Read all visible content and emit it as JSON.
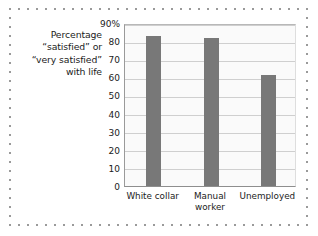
{
  "caption": {
    "lines": [
      "Percentage",
      "“satisfied” or",
      "“very satisfied”",
      "with life"
    ]
  },
  "chart_data": {
    "type": "bar",
    "title": "",
    "subtitle": "",
    "xlabel": "",
    "ylabel": "Percentage “satisfied” or “very satisfied” with life",
    "categories": [
      "White collar",
      "Manual worker",
      "Unemployed"
    ],
    "category_lines": [
      [
        "White collar"
      ],
      [
        "Manual",
        "worker"
      ],
      [
        "Unemployed"
      ]
    ],
    "values": [
      83,
      81.5,
      61.5
    ],
    "ylim": [
      0,
      90
    ],
    "yticks": [
      0,
      10,
      20,
      30,
      40,
      50,
      60,
      70,
      80,
      90
    ],
    "ytick_labels": [
      "0",
      "10",
      "20",
      "30",
      "40",
      "50",
      "60",
      "70",
      "80",
      "90%"
    ],
    "grid": true,
    "legend": "none",
    "bar_color": "#787878",
    "plot_background": "#fafafa",
    "gridline_color": "#cfcfcf"
  }
}
